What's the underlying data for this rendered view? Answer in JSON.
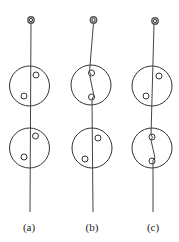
{
  "figure": {
    "panels": [
      {
        "label": "(a)",
        "ring": {
          "cx": 31,
          "cy": 20,
          "r": 3.2,
          "inner_r": 1.6
        },
        "thread": "M31,23 L30,212",
        "discs": [
          {
            "cx": 29.5,
            "cy": 86,
            "r": 20,
            "holes": [
              {
                "cx": 36,
                "cy": 75
              },
              {
                "cx": 24,
                "cy": 96
              }
            ]
          },
          {
            "cx": 29.5,
            "cy": 148,
            "r": 20,
            "holes": [
              {
                "cx": 35.5,
                "cy": 136
              },
              {
                "cx": 24,
                "cy": 157
              }
            ]
          }
        ],
        "label_x": 29,
        "label_y": 231
      },
      {
        "label": "(b)",
        "ring": {
          "cx": 93.5,
          "cy": 20,
          "r": 3.2,
          "inner_r": 1.6
        },
        "thread": "M93.5,23 L89.5,72 Q92,74 90,77 L94,96 Q92,98 92,100 L93,212",
        "discs": [
          {
            "cx": 91,
            "cy": 85,
            "r": 20,
            "holes": [
              {
                "cx": 91.5,
                "cy": 73
              },
              {
                "cx": 91.5,
                "cy": 97
              }
            ]
          },
          {
            "cx": 92,
            "cy": 148,
            "r": 20,
            "holes": [
              {
                "cx": 98,
                "cy": 138
              },
              {
                "cx": 85,
                "cy": 159
              }
            ]
          }
        ],
        "label_x": 92,
        "label_y": 231
      },
      {
        "label": "(c)",
        "ring": {
          "cx": 155,
          "cy": 21,
          "r": 3.2,
          "inner_r": 1.6
        },
        "thread": "M154,24 L151,135 Q154,137 151,140 L155,158 Q152,160 153,163 L153,212",
        "discs": [
          {
            "cx": 152,
            "cy": 86,
            "r": 20,
            "holes": [
              {
                "cx": 159,
                "cy": 76
              },
              {
                "cx": 146,
                "cy": 96
              }
            ]
          },
          {
            "cx": 152,
            "cy": 148,
            "r": 20,
            "holes": [
              {
                "cx": 152,
                "cy": 137
              },
              {
                "cx": 152,
                "cy": 161
              }
            ]
          }
        ],
        "label_x": 153,
        "label_y": 231
      }
    ],
    "hole_radius": 3,
    "colors": {
      "stroke": "#333333",
      "background": "#ffffff"
    }
  }
}
